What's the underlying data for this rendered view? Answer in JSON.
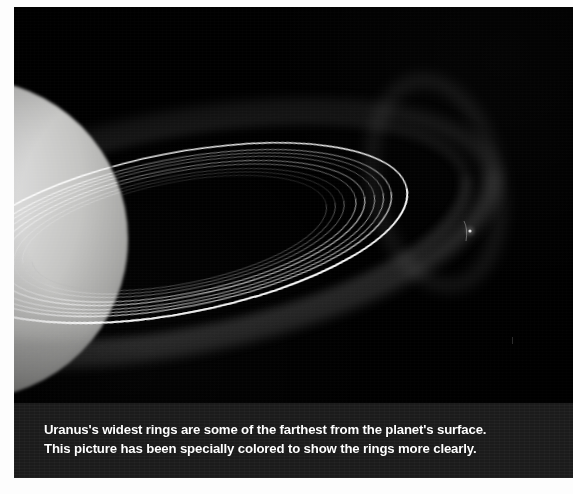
{
  "figure": {
    "caption_lines": [
      "Uranus's widest rings are some of the farthest from the planet's surface.",
      "This picture has been specially colored to show the rings more clearly."
    ],
    "caption_band_color": "#1d1d1d",
    "caption_text_color": "#ffffff",
    "photo_background_color": "#000000",
    "page_background_color": "#fdfdfd"
  },
  "scene": {
    "planet": {
      "name": "planet-uranus",
      "center_x": -46,
      "center_y": 232,
      "radius": 160,
      "highlight_color": "#e8e8e6",
      "body_color": "#c9c9c6",
      "shadow_color": "#8e8e8c"
    },
    "moon": {
      "name": "moon-point",
      "x": 456,
      "y": 224,
      "brightness": "faint"
    },
    "rings": [
      {
        "label": "outer-diffuse-mu-ring",
        "rx": 318,
        "ry": 112,
        "opacity": 0.17,
        "width": 17,
        "color": "#9a9a9a"
      },
      {
        "label": "outer-diffuse-nu-ring",
        "rx": 292,
        "ry": 100,
        "opacity": 0.13,
        "width": 12,
        "color": "#8d8d8d"
      },
      {
        "label": "epsilon-ring",
        "rx": 232,
        "ry": 80,
        "opacity": 0.95,
        "width": 1.5,
        "color": "#ffffff"
      },
      {
        "label": "delta-ring",
        "rx": 216,
        "ry": 74,
        "opacity": 0.58,
        "width": 1.1,
        "color": "#e6e6e6"
      },
      {
        "label": "gamma-ring",
        "rx": 208,
        "ry": 71,
        "opacity": 0.5,
        "width": 1.0,
        "color": "#dcdcdc"
      },
      {
        "label": "eta-ring",
        "rx": 199,
        "ry": 68,
        "opacity": 0.46,
        "width": 1.0,
        "color": "#d4d4d4"
      },
      {
        "label": "beta-ring",
        "rx": 189,
        "ry": 64,
        "opacity": 0.55,
        "width": 1.1,
        "color": "#dedede"
      },
      {
        "label": "alpha-ring",
        "rx": 180,
        "ry": 61,
        "opacity": 0.5,
        "width": 1.0,
        "color": "#d6d6d6"
      },
      {
        "label": "ring-4",
        "rx": 168,
        "ry": 57,
        "opacity": 0.34,
        "width": 0.9,
        "color": "#bdbdbd"
      },
      {
        "label": "ring-5",
        "rx": 159,
        "ry": 54,
        "opacity": 0.3,
        "width": 0.9,
        "color": "#b5b5b5"
      },
      {
        "label": "ring-6",
        "rx": 150,
        "ry": 51,
        "opacity": 0.26,
        "width": 0.9,
        "color": "#ababab"
      }
    ],
    "ring_tilt_degrees": -11
  }
}
